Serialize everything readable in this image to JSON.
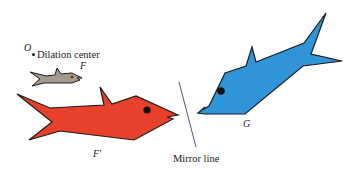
{
  "figure": {
    "labels": {
      "dilation_point": "O",
      "dilation_center": "Dilation center",
      "original_fish": "F",
      "dilated_fish": "F′",
      "reflected_fish": "G",
      "mirror_line": "Mirror line"
    },
    "colors": {
      "original_fish": "#a39b8f",
      "dilated_fish": "#e8402a",
      "reflected_fish": "#2f95d8",
      "outline": "#1b1b1b",
      "eye": "#111111",
      "mirror_line": "#4a5a78"
    },
    "shapes": [
      {
        "name": "F",
        "description": "small gray fish (original)"
      },
      {
        "name": "F′",
        "description": "large red fish (dilation of F about O)"
      },
      {
        "name": "G",
        "description": "blue fish (reflection of F′ across mirror line)"
      }
    ]
  }
}
